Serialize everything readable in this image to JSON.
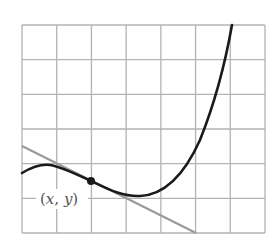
{
  "diagram": {
    "type": "function-graph-with-tangent",
    "grid": {
      "columns": 7,
      "rows": 6,
      "left": 22,
      "top": 25,
      "right": 265,
      "bottom": 233,
      "line_color": "#b3b3b3"
    },
    "curve": {
      "color": "#1a1a1a",
      "width": 2.6,
      "path": "M22,173 C32,167 42,164 50,165 C62,167 78,175 91,181 C106,188 122,197 140,196 C162,195 182,180 200,140 C214,105 224,70 232,25"
    },
    "tangent_line": {
      "color": "#9a9a9a",
      "width": 2.2,
      "x1": 22,
      "y1": 146,
      "x2": 196,
      "y2": 233
    },
    "point": {
      "cx": 91,
      "cy": 181,
      "r": 4,
      "color": "#1a1a1a",
      "label": {
        "open": "(",
        "x": "x",
        "comma": ", ",
        "y": "y",
        "close": ")"
      }
    }
  }
}
